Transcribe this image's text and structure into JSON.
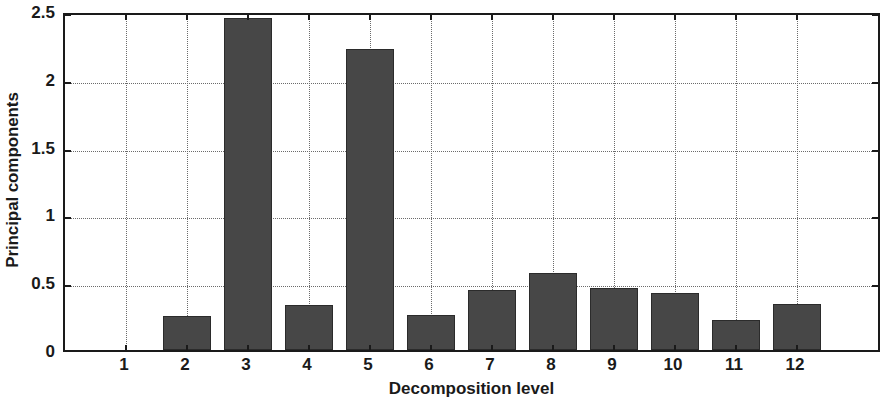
{
  "chart_data": {
    "type": "bar",
    "title": "",
    "subtitle": "",
    "xlabel": "Decomposition level",
    "ylabel": "Principal components",
    "categories": [
      "1",
      "2",
      "3",
      "4",
      "5",
      "6",
      "7",
      "8",
      "9",
      "10",
      "11",
      "12"
    ],
    "values": [
      0,
      0.25,
      2.45,
      0.33,
      2.22,
      0.26,
      0.44,
      0.57,
      0.46,
      0.42,
      0.22,
      0.34
    ],
    "series": [
      {
        "name": "Principal components",
        "values": [
          0,
          0.25,
          2.45,
          0.33,
          2.22,
          0.26,
          0.44,
          0.57,
          0.46,
          0.42,
          0.22,
          0.34
        ]
      }
    ],
    "ylim": [
      0,
      2.5
    ],
    "yticks": [
      0,
      0.5,
      1,
      1.5,
      2,
      2.5
    ],
    "ytick_labels": [
      "0",
      "0.5",
      "1",
      "1.5",
      "2",
      "2.5"
    ],
    "xtick_labels": [
      "1",
      "2",
      "3",
      "4",
      "5",
      "6",
      "7",
      "8",
      "9",
      "10",
      "11",
      "12"
    ],
    "grid": true,
    "grid_style": "dotted",
    "legend": "none",
    "bar_color": "#474747",
    "bar_edge_color": "#2b2b2b",
    "axis_color": "#1a1a1a",
    "background_color": "#ffffff",
    "grid_color": "#6b6b6b"
  }
}
